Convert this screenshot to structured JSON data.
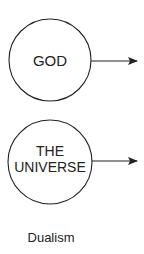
{
  "diagram": {
    "nodes": [
      {
        "id": "god",
        "lines": [
          "GOD"
        ],
        "cx": 50,
        "cy": 60,
        "r": 41
      },
      {
        "id": "universe",
        "lines": [
          "THE",
          "UNIVERSE"
        ],
        "cx": 50,
        "cy": 162,
        "r": 42
      }
    ],
    "arrows": [
      {
        "from": "god",
        "direction": "right"
      },
      {
        "from": "universe",
        "direction": "right"
      }
    ],
    "caption": "Dualism",
    "colors": {
      "stroke": "#222222",
      "text": "#222222",
      "background": "#ffffff"
    }
  }
}
